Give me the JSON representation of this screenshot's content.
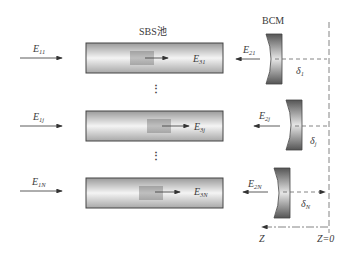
{
  "title": "SBS池",
  "bcm_label": "BCM",
  "axis": {
    "z_label": "Z",
    "zero_label": "Z=0"
  },
  "rows": [
    {
      "input": {
        "base": "E",
        "sub": "11"
      },
      "cell_out": {
        "base": "E",
        "sub": "31"
      },
      "reflected": {
        "base": "E",
        "sub": "21"
      },
      "offset": {
        "base": "δ",
        "sub": "1"
      }
    },
    {
      "input": {
        "base": "E",
        "sub": "1j"
      },
      "cell_out": {
        "base": "E",
        "sub": "3j"
      },
      "reflected": {
        "base": "E",
        "sub": "2j"
      },
      "offset": {
        "base": "δ",
        "sub": "j"
      }
    },
    {
      "input": {
        "base": "E",
        "sub": "1N"
      },
      "cell_out": {
        "base": "E",
        "sub": "3N"
      },
      "reflected": {
        "base": "E",
        "sub": "2N"
      },
      "offset": {
        "base": "δ",
        "sub": "N"
      }
    }
  ],
  "ellipsis": "⋮",
  "colors": {
    "line": "#333333",
    "cell_edge": "#444444",
    "mirror_dark": "#555555",
    "mirror_light": "#dddddd",
    "dash": "#666666"
  }
}
